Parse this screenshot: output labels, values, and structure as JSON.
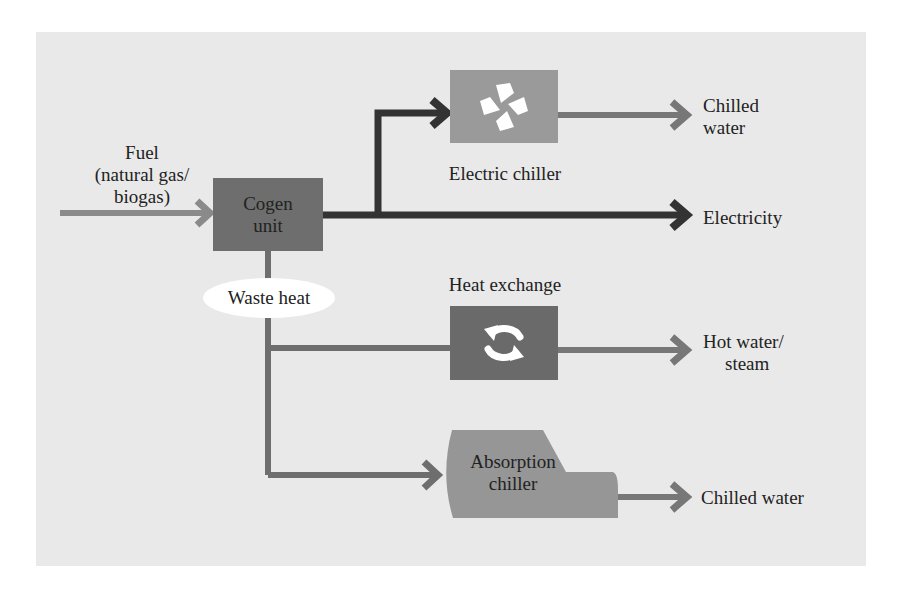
{
  "diagram": {
    "title": "",
    "colors": {
      "background": "#e9e9e9",
      "cogen_box": "#6e6e6e",
      "electric_chiller_box": "#9a9a9a",
      "heat_exchange_box": "#6a6a6a",
      "absorption_chiller_box": "#969696",
      "fuel_arrow": "#8a8a8a",
      "electric_arrow": "#333333",
      "thermal_arrow": "#777777",
      "waste_heat_pill": "#ffffff"
    },
    "nodes": {
      "fuel": {
        "label_line1": "Fuel",
        "label_line2": "(natural gas/",
        "label_line3": "biogas)"
      },
      "cogen": {
        "label_line1": "Cogen",
        "label_line2": "unit"
      },
      "waste_heat": {
        "label": "Waste heat"
      },
      "electric_chiller": {
        "label": "Electric chiller",
        "icon": "fan-icon"
      },
      "heat_exchange": {
        "label": "Heat exchange",
        "icon": "cycle-arrows-icon"
      },
      "absorption_chiller": {
        "label_line1": "Absorption",
        "label_line2": "chiller"
      }
    },
    "outputs": {
      "chilled_water_1": {
        "line1": "Chilled",
        "line2": "water"
      },
      "electricity": {
        "label": "Electricity"
      },
      "hot_water": {
        "line1": "Hot water/",
        "line2": "steam"
      },
      "chilled_water_2": {
        "label": "Chilled water"
      }
    },
    "edges": [
      {
        "from": "fuel",
        "to": "cogen"
      },
      {
        "from": "cogen",
        "to": "electric_chiller"
      },
      {
        "from": "cogen",
        "to": "electricity"
      },
      {
        "from": "electric_chiller",
        "to": "chilled_water_1"
      },
      {
        "from": "cogen",
        "to": "waste_heat"
      },
      {
        "from": "waste_heat",
        "to": "heat_exchange"
      },
      {
        "from": "heat_exchange",
        "to": "hot_water"
      },
      {
        "from": "waste_heat",
        "to": "absorption_chiller"
      },
      {
        "from": "absorption_chiller",
        "to": "chilled_water_2"
      }
    ]
  }
}
